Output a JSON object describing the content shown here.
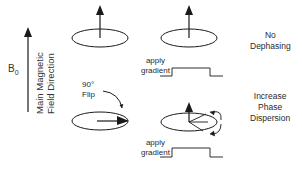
{
  "axis": {
    "symbol": "B",
    "subscript": "0",
    "label_line1": "Main Magnetic",
    "label_line2": "Field Direction"
  },
  "top_row": {
    "gradient_label_line1": "apply",
    "gradient_label_line2": "gradient",
    "result_line1": "No",
    "result_line2": "Dephasing"
  },
  "flip": {
    "label_line1": "90°",
    "label_line2": "Flip"
  },
  "bottom_row": {
    "gradient_label_line1": "apply",
    "gradient_label_line2": "gradient",
    "result_line1": "Increase",
    "result_line2": "Phase",
    "result_line3": "Dispersion"
  },
  "colors": {
    "stroke": "#1a1a1a",
    "background": "#ffffff"
  }
}
